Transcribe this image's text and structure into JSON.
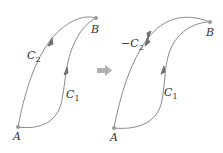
{
  "diagram": {
    "type": "path-reversal",
    "colors": {
      "curve": "#8a8a8a",
      "arrow": "#707070",
      "point": "#9a9a9a",
      "transition_arrow": "#b0b0b0",
      "text": "#333333"
    },
    "left_panel": {
      "point_a": "A",
      "point_b": "B",
      "curve_upper_label": "C",
      "curve_upper_sub": "2",
      "curve_lower_label": "C",
      "curve_lower_sub": "1"
    },
    "transition_icon": "right-arrow-icon",
    "right_panel": {
      "point_a": "A",
      "point_b": "B",
      "curve_upper_label": "−C",
      "curve_upper_sub": "2",
      "curve_lower_label": "C",
      "curve_lower_sub": "1"
    }
  }
}
